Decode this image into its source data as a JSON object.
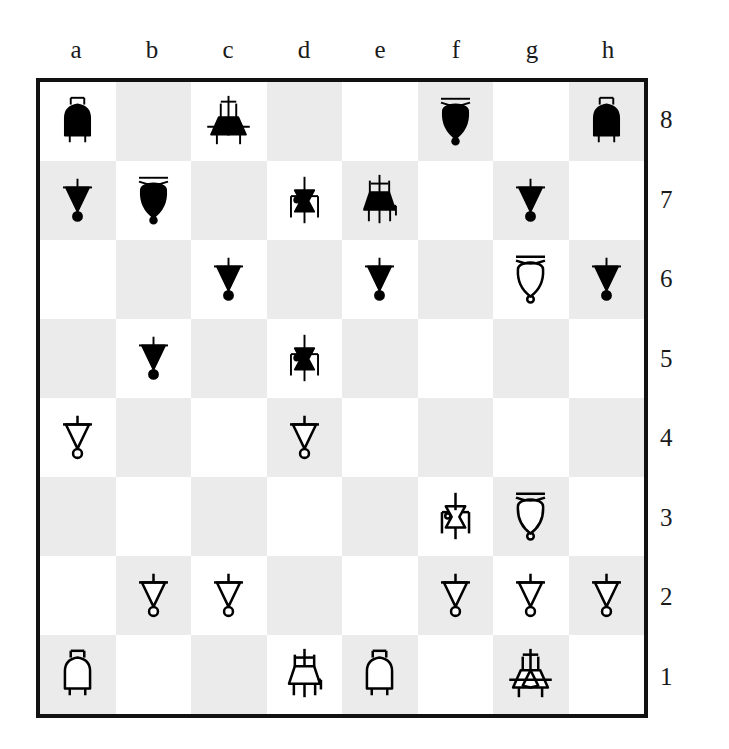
{
  "board": {
    "orientation": "rotated-180",
    "files": [
      "a",
      "b",
      "c",
      "d",
      "e",
      "f",
      "g",
      "h"
    ],
    "ranks": [
      "8",
      "7",
      "6",
      "5",
      "4",
      "3",
      "2",
      "1"
    ],
    "colors": {
      "light_square": "#ffffff",
      "dark_square": "#ebebeb",
      "border": "#111111",
      "black_piece": "#000000",
      "white_piece_fill": "#ffffff",
      "white_piece_stroke": "#000000"
    },
    "squares": [
      [
        {
          "square": "a8",
          "shade": "light",
          "piece": "rook",
          "color": "black"
        },
        {
          "square": "b8",
          "shade": "dark",
          "piece": null,
          "color": null
        },
        {
          "square": "c8",
          "shade": "light",
          "piece": "king",
          "color": "black"
        },
        {
          "square": "d8",
          "shade": "dark",
          "piece": null,
          "color": null
        },
        {
          "square": "e8",
          "shade": "light",
          "piece": null,
          "color": null
        },
        {
          "square": "f8",
          "shade": "dark",
          "piece": "bishop",
          "color": "black"
        },
        {
          "square": "g8",
          "shade": "light",
          "piece": null,
          "color": null
        },
        {
          "square": "h8",
          "shade": "dark",
          "piece": "rook",
          "color": "black"
        }
      ],
      [
        {
          "square": "a7",
          "shade": "dark",
          "piece": "pawn",
          "color": "black"
        },
        {
          "square": "b7",
          "shade": "light",
          "piece": "bishop",
          "color": "black"
        },
        {
          "square": "c7",
          "shade": "dark",
          "piece": null,
          "color": null
        },
        {
          "square": "d7",
          "shade": "light",
          "piece": "knight",
          "color": "black"
        },
        {
          "square": "e7",
          "shade": "dark",
          "piece": "queen",
          "color": "black"
        },
        {
          "square": "f7",
          "shade": "light",
          "piece": null,
          "color": null
        },
        {
          "square": "g7",
          "shade": "dark",
          "piece": "pawn",
          "color": "black"
        },
        {
          "square": "h7",
          "shade": "light",
          "piece": null,
          "color": null
        }
      ],
      [
        {
          "square": "a6",
          "shade": "light",
          "piece": null,
          "color": null
        },
        {
          "square": "b6",
          "shade": "dark",
          "piece": null,
          "color": null
        },
        {
          "square": "c6",
          "shade": "light",
          "piece": "pawn",
          "color": "black"
        },
        {
          "square": "d6",
          "shade": "dark",
          "piece": null,
          "color": null
        },
        {
          "square": "e6",
          "shade": "light",
          "piece": "pawn",
          "color": "black"
        },
        {
          "square": "f6",
          "shade": "dark",
          "piece": null,
          "color": null
        },
        {
          "square": "g6",
          "shade": "light",
          "piece": "bishop",
          "color": "white"
        },
        {
          "square": "h6",
          "shade": "dark",
          "piece": "pawn",
          "color": "black"
        }
      ],
      [
        {
          "square": "a5",
          "shade": "dark",
          "piece": null,
          "color": null
        },
        {
          "square": "b5",
          "shade": "light",
          "piece": "pawn",
          "color": "black"
        },
        {
          "square": "c5",
          "shade": "dark",
          "piece": null,
          "color": null
        },
        {
          "square": "d5",
          "shade": "light",
          "piece": "knight",
          "color": "black"
        },
        {
          "square": "e5",
          "shade": "dark",
          "piece": null,
          "color": null
        },
        {
          "square": "f5",
          "shade": "light",
          "piece": null,
          "color": null
        },
        {
          "square": "g5",
          "shade": "dark",
          "piece": null,
          "color": null
        },
        {
          "square": "h5",
          "shade": "light",
          "piece": null,
          "color": null
        }
      ],
      [
        {
          "square": "a4",
          "shade": "light",
          "piece": "pawn",
          "color": "white"
        },
        {
          "square": "b4",
          "shade": "dark",
          "piece": null,
          "color": null
        },
        {
          "square": "c4",
          "shade": "light",
          "piece": null,
          "color": null
        },
        {
          "square": "d4",
          "shade": "dark",
          "piece": "pawn",
          "color": "white"
        },
        {
          "square": "e4",
          "shade": "light",
          "piece": null,
          "color": null
        },
        {
          "square": "f4",
          "shade": "dark",
          "piece": null,
          "color": null
        },
        {
          "square": "g4",
          "shade": "light",
          "piece": null,
          "color": null
        },
        {
          "square": "h4",
          "shade": "dark",
          "piece": null,
          "color": null
        }
      ],
      [
        {
          "square": "a3",
          "shade": "dark",
          "piece": null,
          "color": null
        },
        {
          "square": "b3",
          "shade": "light",
          "piece": null,
          "color": null
        },
        {
          "square": "c3",
          "shade": "dark",
          "piece": null,
          "color": null
        },
        {
          "square": "d3",
          "shade": "light",
          "piece": null,
          "color": null
        },
        {
          "square": "e3",
          "shade": "dark",
          "piece": null,
          "color": null
        },
        {
          "square": "f3",
          "shade": "light",
          "piece": "knight",
          "color": "white"
        },
        {
          "square": "g3",
          "shade": "dark",
          "piece": "bishop",
          "color": "white"
        },
        {
          "square": "h3",
          "shade": "light",
          "piece": null,
          "color": null
        }
      ],
      [
        {
          "square": "a2",
          "shade": "light",
          "piece": null,
          "color": null
        },
        {
          "square": "b2",
          "shade": "dark",
          "piece": "pawn",
          "color": "white"
        },
        {
          "square": "c2",
          "shade": "light",
          "piece": "pawn",
          "color": "white"
        },
        {
          "square": "d2",
          "shade": "dark",
          "piece": null,
          "color": null
        },
        {
          "square": "e2",
          "shade": "light",
          "piece": null,
          "color": null
        },
        {
          "square": "f2",
          "shade": "dark",
          "piece": "pawn",
          "color": "white"
        },
        {
          "square": "g2",
          "shade": "light",
          "piece": "pawn",
          "color": "white"
        },
        {
          "square": "h2",
          "shade": "dark",
          "piece": "pawn",
          "color": "white"
        }
      ],
      [
        {
          "square": "a1",
          "shade": "dark",
          "piece": "rook",
          "color": "white"
        },
        {
          "square": "b1",
          "shade": "light",
          "piece": null,
          "color": null
        },
        {
          "square": "c1",
          "shade": "dark",
          "piece": null,
          "color": null
        },
        {
          "square": "d1",
          "shade": "light",
          "piece": "queen",
          "color": "white"
        },
        {
          "square": "e1",
          "shade": "dark",
          "piece": "rook",
          "color": "white"
        },
        {
          "square": "f1",
          "shade": "light",
          "piece": null,
          "color": null
        },
        {
          "square": "g1",
          "shade": "dark",
          "piece": "king",
          "color": "white"
        },
        {
          "square": "h1",
          "shade": "light",
          "piece": null,
          "color": null
        }
      ]
    ]
  }
}
